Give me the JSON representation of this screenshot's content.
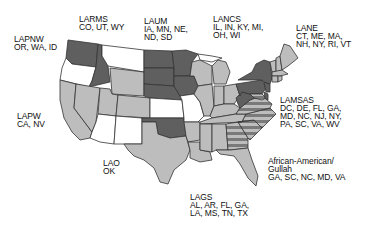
{
  "map": {
    "colors": {
      "dark": "#5f5f5f",
      "light": "#bdbdbd",
      "none": "#ffffff",
      "stripe_a": "#7a7a7a",
      "stripe_b": "#bdbdbd",
      "border": "#333333"
    },
    "regions": [
      {
        "id": "lapnw",
        "name": "LAPNW",
        "states": "OR, WA, ID",
        "shade": "dark (WA, ID)"
      },
      {
        "id": "larms",
        "name": "LARMS",
        "states": "CO, UT, WY",
        "shade": "light"
      },
      {
        "id": "laum",
        "name": "LAUM",
        "states": "IA, MN, NE, ND, SD",
        "shade": "dark"
      },
      {
        "id": "lancs",
        "name": "LANCS",
        "states": "IL, IN, KY, MI, OH, WI",
        "shade": "light"
      },
      {
        "id": "lane",
        "name": "LANE",
        "states": "CT, ME, MA, NH, NY, RI, VT",
        "shade": "light"
      },
      {
        "id": "lamsas",
        "name": "LAMSAS",
        "states": "DC, DE, FL, GA, MD, NC, NJ, NY, PA, SC, VA, WV",
        "shade": "dark"
      },
      {
        "id": "lapw",
        "name": "LAPW",
        "states": "CA, NV",
        "shade": "light"
      },
      {
        "id": "lao",
        "name": "LAO",
        "states": "OK",
        "shade": "dark"
      },
      {
        "id": "lags",
        "name": "LAGS",
        "states": "AL, AR, FL, GA, LA, MS, TN, TX",
        "shade": "light"
      },
      {
        "id": "gullah",
        "name": "African-American/ Gullah",
        "states": "GA, SC, NC, MD, VA",
        "shade": "striped"
      }
    ]
  },
  "labels": {
    "lapnw": {
      "line1": "LAPNW",
      "line2": "OR, WA, ID"
    },
    "larms": {
      "line1": "LARMS",
      "line2": "CO, UT, WY"
    },
    "laum": {
      "line1": "LAUM",
      "line2": "IA, MN, NE,",
      "line3": "ND, SD"
    },
    "lancs": {
      "line1": "LANCS",
      "line2": "IL, IN, KY, MI,",
      "line3": "OH, WI"
    },
    "lane": {
      "line1": "LANE",
      "line2": "CT, ME, MA,",
      "line3": "NH, NY, RI, VT"
    },
    "lamsas": {
      "line1": "LAMSAS",
      "line2": "DC, DE, FL, GA,",
      "line3": "MD, NC, NJ, NY,",
      "line4": "PA, SC, VA, WV"
    },
    "lapw": {
      "line1": "LAPW",
      "line2": "CA, NV"
    },
    "lao": {
      "line1": "LAO",
      "line2": "OK"
    },
    "lags": {
      "line1": "LAGS",
      "line2": "AL, AR, FL, GA,",
      "line3": "LA, MS, TN, TX"
    },
    "gullah": {
      "line1": "African-American/",
      "line2": "Gullah",
      "line3": "GA, SC, NC, MD, VA"
    }
  }
}
